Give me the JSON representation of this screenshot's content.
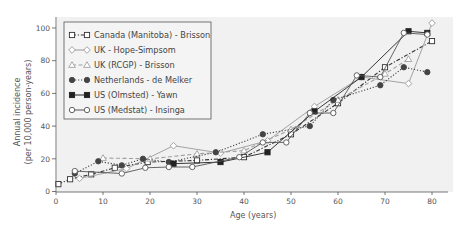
{
  "chart_data": {
    "type": "line",
    "title": "",
    "xlabel": "Age (years)",
    "ylabel": "Annual incidence",
    "ylabel_line2": "(per 10,000 person-years)",
    "xlim": [
      0,
      85
    ],
    "ylim": [
      0,
      105
    ],
    "xticks": [
      0,
      10,
      20,
      30,
      40,
      50,
      60,
      70,
      80
    ],
    "yticks": [
      0,
      20,
      40,
      60,
      80,
      100
    ],
    "grid": false,
    "legend_position": "upper left",
    "series": [
      {
        "name": "Canada (Manitoba) - Brisson",
        "marker": "open-square",
        "line": "dash-dot",
        "color": "#333333",
        "x": [
          0.5,
          3,
          7.5,
          12.5,
          19.5,
          30,
          40,
          50,
          60,
          70,
          80
        ],
        "y": [
          4.5,
          7.5,
          10.5,
          14.5,
          18,
          19,
          21,
          35,
          54,
          76,
          92
        ]
      },
      {
        "name": "UK - Hope-Simpsom",
        "marker": "open-diamond",
        "line": "solid",
        "color": "#9a9a9a",
        "x": [
          5,
          15,
          25,
          35,
          45,
          55,
          65,
          75,
          80
        ],
        "y": [
          8,
          14,
          28,
          23.5,
          31,
          52,
          70,
          66,
          103
        ]
      },
      {
        "name": "UK (RCGP) - Brisson",
        "marker": "open-triangle",
        "line": "dashed",
        "color": "#a0a0a0",
        "x": [
          10,
          20,
          30,
          40,
          50,
          60,
          70,
          75
        ],
        "y": [
          20.5,
          20,
          23,
          25,
          38,
          56,
          72,
          81
        ]
      },
      {
        "name": "Netherlands - de Melker",
        "marker": "filled-circle",
        "line": "dotted",
        "color": "#444444",
        "x": [
          4,
          9,
          14,
          18.5,
          24,
          34,
          44,
          54,
          59,
          69,
          74,
          79
        ],
        "y": [
          11,
          18.5,
          16,
          20,
          18,
          24,
          35,
          40,
          56,
          65,
          76,
          73
        ]
      },
      {
        "name": "US (Olmsted) - Yawn",
        "marker": "filled-square",
        "line": "solid",
        "color": "#222222",
        "x": [
          25,
          35,
          45,
          55,
          65,
          75,
          79
        ],
        "y": [
          17,
          18,
          24,
          49,
          70,
          98,
          97
        ]
      },
      {
        "name": "US (Medstat) - Insinga",
        "marker": "open-circle",
        "line": "solid",
        "color": "#555555",
        "x": [
          4,
          14,
          19,
          24,
          29,
          39,
          44,
          49,
          54,
          59,
          64,
          69,
          74,
          79
        ],
        "y": [
          12.5,
          11,
          14.5,
          15,
          15,
          21,
          30,
          30,
          48,
          48,
          71,
          70,
          97,
          96
        ]
      }
    ]
  }
}
